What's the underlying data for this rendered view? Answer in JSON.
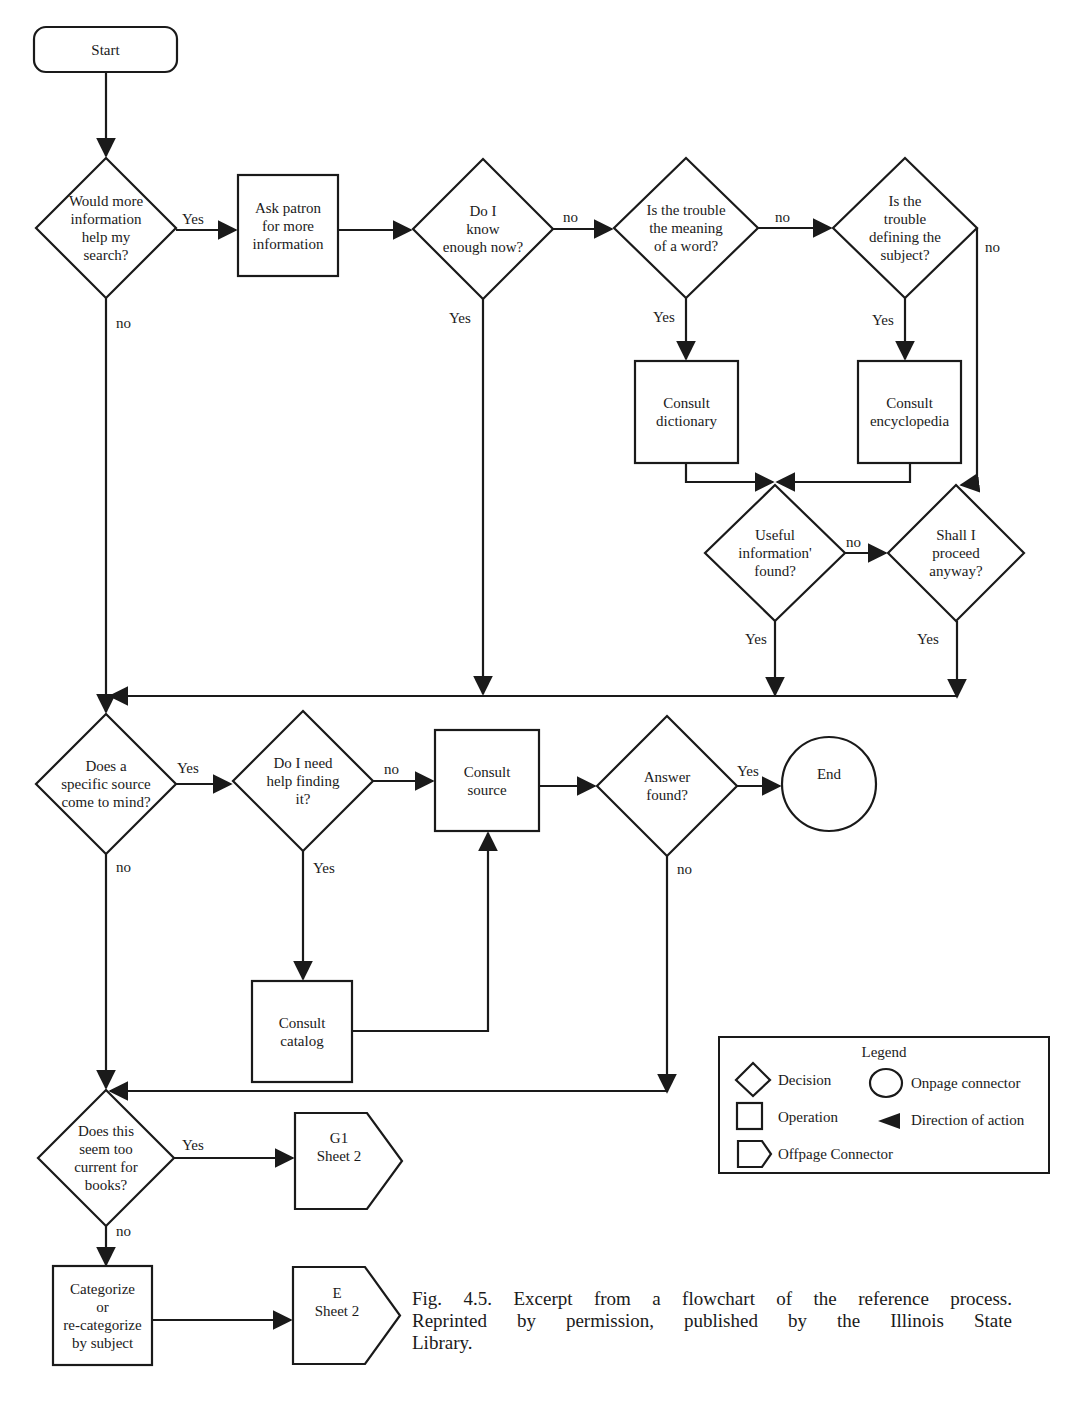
{
  "figure": {
    "caption_lines": [
      "Fig. 4.5. Excerpt from a flowchart of the reference process.",
      "Reprinted by permission, published by the Illinois State",
      "Library."
    ]
  },
  "nodes": [
    {
      "id": "start",
      "type": "terminal",
      "x": 34,
      "y": 27,
      "w": 143,
      "h": 45,
      "lines": [
        "Start"
      ]
    },
    {
      "id": "more_info",
      "type": "decision",
      "cx": 106,
      "cy": 228,
      "rx": 70,
      "ry": 70,
      "lines": [
        "Would more",
        "information",
        "help my",
        "search?"
      ]
    },
    {
      "id": "ask_patron",
      "type": "operation",
      "x": 238,
      "y": 175,
      "w": 100,
      "h": 101,
      "lines": [
        "Ask patron",
        "for more",
        "information"
      ]
    },
    {
      "id": "know_enough",
      "type": "decision",
      "cx": 483,
      "cy": 229,
      "rx": 70,
      "ry": 70,
      "lines": [
        "Do I",
        "know",
        "enough now?"
      ]
    },
    {
      "id": "meaning_word",
      "type": "decision",
      "cx": 686,
      "cy": 228,
      "rx": 72,
      "ry": 70,
      "lines": [
        "Is the trouble",
        "the meaning",
        "of a word?"
      ]
    },
    {
      "id": "defining_subject",
      "type": "decision",
      "cx": 905,
      "cy": 228,
      "rx": 72,
      "ry": 70,
      "lines": [
        "Is the",
        "trouble",
        "defining the",
        "subject?"
      ]
    },
    {
      "id": "dictionary",
      "type": "operation",
      "x": 635,
      "y": 361,
      "w": 103,
      "h": 102,
      "lines": [
        "Consult",
        "dictionary"
      ]
    },
    {
      "id": "encyclopedia",
      "type": "operation",
      "x": 858,
      "y": 361,
      "w": 103,
      "h": 102,
      "lines": [
        "Consult",
        "encyclopedia"
      ]
    },
    {
      "id": "useful_info",
      "type": "decision",
      "cx": 775,
      "cy": 553,
      "rx": 70,
      "ry": 68,
      "lines": [
        "Useful",
        "information'",
        "found?"
      ]
    },
    {
      "id": "proceed_anyway",
      "type": "decision",
      "cx": 956,
      "cy": 553,
      "rx": 68,
      "ry": 68,
      "lines": [
        "Shall I",
        "proceed",
        "anyway?"
      ]
    },
    {
      "id": "specific_source",
      "type": "decision",
      "cx": 106,
      "cy": 784,
      "rx": 70,
      "ry": 70,
      "lines": [
        "Does a",
        "specific source",
        "come to mind?"
      ]
    },
    {
      "id": "help_finding",
      "type": "decision",
      "cx": 303,
      "cy": 781,
      "rx": 70,
      "ry": 70,
      "lines": [
        "Do I need",
        "help finding",
        "it?"
      ]
    },
    {
      "id": "consult_source",
      "type": "operation",
      "x": 435,
      "y": 730,
      "w": 104,
      "h": 101,
      "lines": [
        "Consult",
        "source"
      ]
    },
    {
      "id": "answer_found",
      "type": "decision",
      "cx": 667,
      "cy": 786,
      "rx": 70,
      "ry": 70,
      "lines": [
        "Answer",
        "found?"
      ]
    },
    {
      "id": "end",
      "type": "connector",
      "cx": 829,
      "cy": 784,
      "r": 47,
      "lines": [
        "End"
      ]
    },
    {
      "id": "consult_catalog",
      "type": "operation",
      "x": 252,
      "y": 981,
      "w": 100,
      "h": 101,
      "lines": [
        "Consult",
        "catalog"
      ]
    },
    {
      "id": "too_current",
      "type": "decision",
      "cx": 106,
      "cy": 1158,
      "rx": 68,
      "ry": 68,
      "lines": [
        "Does this",
        "seem too",
        "current for",
        "books?"
      ]
    },
    {
      "id": "g1_sheet2",
      "type": "offpage",
      "x": 295,
      "y": 1113,
      "w": 107,
      "h": 96,
      "lines": [
        "G1",
        "Sheet 2"
      ]
    },
    {
      "id": "categorize",
      "type": "operation",
      "x": 53,
      "y": 1266,
      "w": 99,
      "h": 99,
      "lines": [
        "Categorize",
        "or",
        "re-categorize",
        "by subject"
      ]
    },
    {
      "id": "e_sheet2",
      "type": "offpage",
      "x": 293,
      "y": 1267,
      "w": 107,
      "h": 97,
      "lines": [
        "E",
        "Sheet 2"
      ]
    }
  ],
  "edges": [
    {
      "from": "start",
      "to": "more_info",
      "label": ""
    },
    {
      "from": "more_info",
      "to": "ask_patron",
      "label": "Yes"
    },
    {
      "from": "more_info",
      "to": "specific_source",
      "label": "no"
    },
    {
      "from": "ask_patron",
      "to": "know_enough",
      "label": ""
    },
    {
      "from": "know_enough",
      "to": "meaning_word",
      "label": "no"
    },
    {
      "from": "know_enough",
      "to": "specific_source",
      "label": "Yes"
    },
    {
      "from": "meaning_word",
      "to": "defining_subject",
      "label": "no"
    },
    {
      "from": "meaning_word",
      "to": "dictionary",
      "label": "Yes"
    },
    {
      "from": "defining_subject",
      "to": "encyclopedia",
      "label": "Yes"
    },
    {
      "from": "defining_subject",
      "to": "proceed_anyway",
      "label": "no"
    },
    {
      "from": "dictionary",
      "to": "useful_info",
      "label": ""
    },
    {
      "from": "encyclopedia",
      "to": "useful_info",
      "label": ""
    },
    {
      "from": "useful_info",
      "to": "proceed_anyway",
      "label": "no"
    },
    {
      "from": "useful_info",
      "to": "specific_source",
      "label": "Yes"
    },
    {
      "from": "proceed_anyway",
      "to": "specific_source",
      "label": "Yes"
    },
    {
      "from": "specific_source",
      "to": "help_finding",
      "label": "Yes"
    },
    {
      "from": "specific_source",
      "to": "too_current",
      "label": "no"
    },
    {
      "from": "help_finding",
      "to": "consult_source",
      "label": "no"
    },
    {
      "from": "help_finding",
      "to": "consult_catalog",
      "label": "Yes"
    },
    {
      "from": "consult_catalog",
      "to": "consult_source",
      "label": ""
    },
    {
      "from": "consult_source",
      "to": "answer_found",
      "label": ""
    },
    {
      "from": "answer_found",
      "to": "end",
      "label": "Yes"
    },
    {
      "from": "answer_found",
      "to": "too_current",
      "label": "no"
    },
    {
      "from": "too_current",
      "to": "g1_sheet2",
      "label": "Yes"
    },
    {
      "from": "too_current",
      "to": "categorize",
      "label": "no"
    },
    {
      "from": "categorize",
      "to": "e_sheet2",
      "label": ""
    }
  ],
  "edge_labels": [
    {
      "text": "Yes",
      "x": 182,
      "y": 224
    },
    {
      "text": "no",
      "x": 116,
      "y": 328
    },
    {
      "text": "no",
      "x": 563,
      "y": 222
    },
    {
      "text": "Yes",
      "x": 449,
      "y": 323
    },
    {
      "text": "no",
      "x": 775,
      "y": 222
    },
    {
      "text": "Yes",
      "x": 653,
      "y": 322
    },
    {
      "text": "no",
      "x": 985,
      "y": 252
    },
    {
      "text": "Yes",
      "x": 872,
      "y": 325
    },
    {
      "text": "no",
      "x": 846,
      "y": 547
    },
    {
      "text": "Yes",
      "x": 745,
      "y": 644
    },
    {
      "text": "Yes",
      "x": 917,
      "y": 644
    },
    {
      "text": "Yes",
      "x": 177,
      "y": 773
    },
    {
      "text": "no",
      "x": 116,
      "y": 872
    },
    {
      "text": "no",
      "x": 384,
      "y": 774
    },
    {
      "text": "Yes",
      "x": 313,
      "y": 873
    },
    {
      "text": "Yes",
      "x": 737,
      "y": 776
    },
    {
      "text": "no",
      "x": 677,
      "y": 874
    },
    {
      "text": "Yes",
      "x": 182,
      "y": 1150
    },
    {
      "text": "no",
      "x": 116,
      "y": 1236
    }
  ],
  "legend": {
    "title": "Legend",
    "items": [
      {
        "shape": "decision",
        "label": "Decision"
      },
      {
        "shape": "connector",
        "label": "Onpage connector"
      },
      {
        "shape": "operation",
        "label": "Operation"
      },
      {
        "shape": "arrow",
        "label": "Direction of action"
      },
      {
        "shape": "offpage",
        "label": "Offpage Connector"
      }
    ]
  }
}
